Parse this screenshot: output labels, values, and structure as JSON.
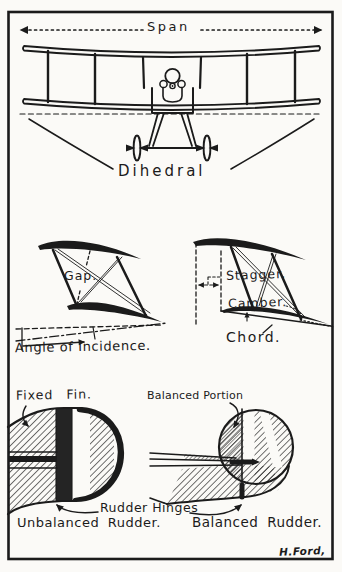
{
  "figure": {
    "ink_color": "#1b1b1b",
    "paper_color": "#fbfaf7"
  },
  "top_panel": {
    "span": "Span",
    "dihedral": "Dihedral"
  },
  "middle_panel": {
    "gap": "Gap.",
    "angle_of_incidence": "Angle of Incidence.",
    "stagger": "Stagger.",
    "camber": "Camber.",
    "chord": "Chord."
  },
  "bottom_panel": {
    "fixed_fin": "Fixed Fin.",
    "balanced_portion": "Balanced Portion",
    "rudder_hinges": "Rudder Hinges",
    "unbalanced_rudder": "Unbalanced Rudder.",
    "balanced_rudder": "Balanced Rudder.",
    "signature": "H.Ford,"
  }
}
